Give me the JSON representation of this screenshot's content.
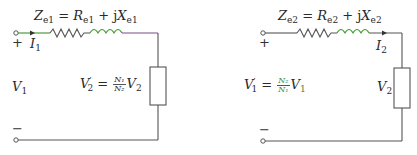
{
  "diagram": {
    "colors": {
      "wire": "#555555",
      "highlight_wire": "#4a9a3a",
      "purple_wire": "#7a4a8a",
      "text": "#2a2a2a"
    },
    "left_circuit": {
      "impedance_label": {
        "Z": "Z",
        "Z_sub": "e1",
        "eq": " = ",
        "R": "R",
        "R_sub": "e1",
        "plus": " + j",
        "X": "X",
        "X_sub": "e1"
      },
      "current_label": {
        "I": "I",
        "sub": "1"
      },
      "voltage_source_label": {
        "V": "V",
        "sub": "1"
      },
      "load_label": {
        "V": "V",
        "sup": "′",
        "sub": "2",
        "eq": " = ",
        "num": "N₁",
        "den": "N₂",
        "V2": "V",
        "V2_sub": "2"
      },
      "plus_sign": "+",
      "minus_sign": "−"
    },
    "right_circuit": {
      "impedance_label": {
        "Z": "Z",
        "Z_sub": "e2",
        "eq": " = ",
        "R": "R",
        "R_sub": "e2",
        "plus": " + j",
        "X": "X",
        "X_sub": "e2"
      },
      "current_label": {
        "I": "I",
        "sub": "2"
      },
      "voltage_source_label": {
        "V": "V",
        "sup": "′",
        "sub": "1",
        "eq": " = ",
        "num": "N₂",
        "den": "N₁",
        "V1": "V",
        "V1_sub": "1"
      },
      "load_label": {
        "V": "V",
        "sub": "2"
      },
      "plus_sign": "+",
      "minus_sign": "−"
    }
  }
}
